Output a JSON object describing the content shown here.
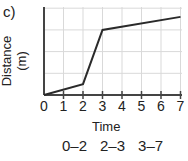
{
  "panel_label": "c)",
  "chart_data": {
    "type": "line",
    "title": "",
    "xlabel": "Time",
    "ylabel": "Distance (m)",
    "x_ticks": [
      "0",
      "1",
      "2",
      "3",
      "4",
      "5",
      "6",
      "7"
    ],
    "xlim": [
      0,
      7
    ],
    "ylim": [
      0,
      4
    ],
    "grid": true,
    "series": [
      {
        "name": "distance",
        "x": [
          0,
          2,
          3,
          7
        ],
        "y": [
          0,
          0.5,
          3.0,
          3.6
        ]
      }
    ],
    "annotations": [
      "0–2",
      "2–3",
      "3–7"
    ]
  },
  "colors": {
    "line": "#2a2a2a",
    "grid": "#d9d9d9",
    "axis": "#444444"
  }
}
